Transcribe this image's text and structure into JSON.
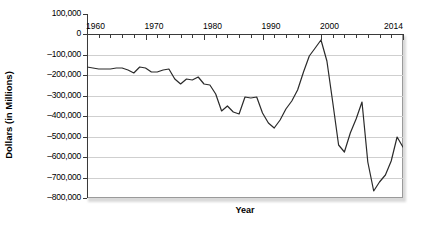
{
  "chart_data": {
    "type": "line",
    "title": "",
    "xlabel": "Year",
    "ylabel": "Dollars (in Millions)",
    "xlim": [
      1960,
      2014
    ],
    "ylim": [
      -800000,
      100000
    ],
    "grid": true,
    "legend": "none",
    "y_ticks": [
      100000,
      0,
      -100000,
      -200000,
      -300000,
      -400000,
      -500000,
      -600000,
      -700000,
      -800000
    ],
    "y_tick_labels": [
      "100,000",
      "0",
      "-100,000",
      "-200,000",
      "-300,000",
      "-400,000",
      "-500,000",
      "-600,000",
      "-700,000",
      "-800,000"
    ],
    "x_ticks": [
      1960,
      1962,
      1964,
      1966,
      1968,
      1970,
      1972,
      1974,
      1976,
      1978,
      1980,
      1982,
      1984,
      1986,
      1988,
      1990,
      1992,
      1994,
      1996,
      1998,
      2000,
      2002,
      2004,
      2006,
      2008,
      2010,
      2012,
      2014
    ],
    "x_tick_labels": [
      "1960",
      "1970",
      "1980",
      "1990",
      "2000",
      "2014"
    ],
    "x_labeled_ticks": [
      1960,
      1970,
      1980,
      1990,
      2000,
      2014
    ],
    "series": [
      {
        "name": "Federal Surplus or Deficit",
        "color": "#2a2a2a",
        "x": [
          1960,
          1961,
          1962,
          1963,
          1964,
          1965,
          1966,
          1967,
          1968,
          1969,
          1970,
          1971,
          1972,
          1973,
          1974,
          1975,
          1976,
          1977,
          1978,
          1979,
          1980,
          1981,
          1982,
          1983,
          1984,
          1985,
          1986,
          1987,
          1988,
          1989,
          1990,
          1991,
          1992,
          1993,
          1994,
          1995,
          1996,
          1997,
          1998,
          1999,
          2000,
          2001,
          2002,
          2003,
          2004,
          2005,
          2006,
          2007,
          2008,
          2009,
          2010,
          2011,
          2012,
          2013,
          2014
        ],
        "y": [
          300,
          -3300,
          -7100,
          -4800,
          -5900,
          -1400,
          -3700,
          -8600,
          -25200,
          3200,
          -2800,
          -23000,
          -23400,
          -14900,
          -6100,
          -53200,
          -73700,
          -53700,
          -59200,
          -40700,
          -73800,
          -79000,
          -128000,
          -207800,
          -185400,
          -212300,
          -221200,
          -149700,
          -155200,
          -152600,
          -221000,
          -269200,
          -290300,
          -255100,
          -203200,
          -164000,
          -107400,
          -21900,
          69300,
          125600,
          236200,
          128200,
          -157800,
          -377600,
          -412700,
          -318300,
          -248200,
          -160700,
          -458600,
          -1412700,
          -1294400,
          -1300000,
          -1087000,
          -679500,
          -484600
        ]
      }
    ],
    "series_pixel_path": "0,33 5.9,34 11.7,35 17.6,35 23.4,35 29.3,34 35.1,34 41,36 46.8,39 52.7,33 58.5,34 64.4,38 70.2,38 76.1,36 81.9,35 87.8,45 93.6,50 99.5,45 105.3,46 111.2,43 117,50 122.9,51 128.7,60 134.6,77 140.4,72 146.3,78 152.1,80 158,63 163.8,64 169.7,63 175.5,79 181.4,89 187.2,94 193.1,86 198.9,75 204.8,67 210.6,56 216.5,38 222.3,22 228.2,14 234,6 239.9,27 245.7,68 251.6,111 257.4,118 263.3,99 269.1,85 275,68 280.8,128 286.7,157 292.5,148 298.4,141 304.2,127 310.1,103 315.9,113"
  },
  "figure": {
    "background_color": "#ffffff",
    "line_color": "#2a2a2a",
    "grid_color": "#cfcfcf",
    "axis_color": "#3a3a3a"
  }
}
